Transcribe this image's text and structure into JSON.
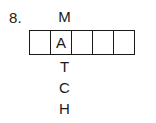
{
  "problem": {
    "number_label": "8.",
    "answer_word": "MATCH",
    "grid": {
      "cell_count": 5,
      "cells": [
        {
          "letter": "",
          "filled": false
        },
        {
          "letter": "A",
          "filled": true
        },
        {
          "letter": "",
          "filled": false
        },
        {
          "letter": "",
          "filled": false
        },
        {
          "letter": "",
          "filled": false
        }
      ],
      "border_color": "#1a1a1a",
      "background_color": "#ffffff"
    },
    "vertical_word": {
      "letter_above": "M",
      "letter_in_grid": "A",
      "letters_below": [
        "T",
        "C",
        "H"
      ]
    },
    "text_color": "#1a1a1a",
    "page_background": "#ffffff"
  }
}
